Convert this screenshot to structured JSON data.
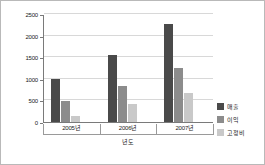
{
  "chart_data": {
    "type": "bar",
    "title": "",
    "subtitle": "",
    "xlabel": "년도",
    "ylabel": "",
    "categories": [
      "2005년",
      "2006년",
      "2007년"
    ],
    "series": [
      {
        "name": "매출",
        "color": "#4a4a4a",
        "values": [
          1000,
          1550,
          2270
        ]
      },
      {
        "name": "이익",
        "color": "#8c8c8c",
        "values": [
          490,
          840,
          1240
        ]
      },
      {
        "name": "고정비",
        "color": "#c9c9c9",
        "values": [
          140,
          420,
          680
        ]
      }
    ],
    "ylim": [
      0,
      2500
    ],
    "yticks": [
      0,
      500,
      1000,
      1500,
      2000,
      2500
    ],
    "ytick_labels": [
      "0",
      "500",
      "1000",
      "1500",
      "2000",
      "2500"
    ],
    "grid": true,
    "grid_axis": "y",
    "legend": true,
    "legend_position": "right",
    "bar_mode": "grouped",
    "background_color": "#ffffff",
    "axis_color": "#7a7a7a",
    "gridline_color": "#d8d8d8",
    "border_color": "#b9b9b9"
  }
}
